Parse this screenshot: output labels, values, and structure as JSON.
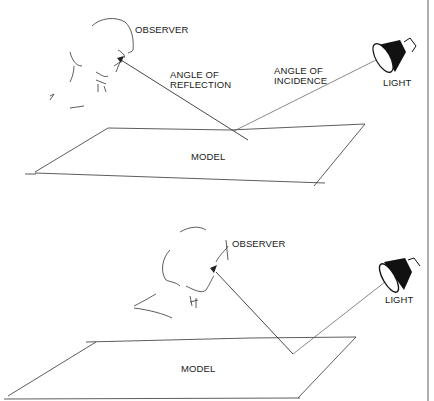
{
  "top_panel": {
    "observer_label": "OBSERVER",
    "reflection_label_1": "ANGLE OF",
    "reflection_label_2": "REFLECTION",
    "incidence_label_1": "ANGLE OF",
    "incidence_label_2": "INCIDENCE",
    "light_label": "LIGHT",
    "model_label": "MODEL"
  },
  "bottom_panel": {
    "observer_label": "OBSERVER",
    "light_label": "LIGHT",
    "model_label": "MODEL"
  },
  "colors": {
    "ink": "#1a1a1a",
    "background": "#ffffff"
  }
}
